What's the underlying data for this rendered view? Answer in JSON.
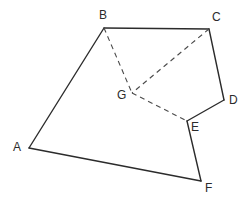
{
  "figure": {
    "name": "hexagon-with-interior-point",
    "width": 248,
    "height": 203,
    "background_color": "#ffffff",
    "stroke_color": "#2b2b2b",
    "dashed_stroke_color": "#4a4a4a",
    "solid_stroke_width": 1.4,
    "dashed_stroke_width": 1.1,
    "dash_pattern": "5,4"
  },
  "points": {
    "A": {
      "label": "A",
      "x": 29,
      "y": 148,
      "label_x": 13,
      "label_y": 141
    },
    "B": {
      "label": "B",
      "x": 104,
      "y": 28,
      "label_x": 99,
      "label_y": 9
    },
    "C": {
      "label": "C",
      "x": 209,
      "y": 29,
      "label_x": 212,
      "label_y": 11
    },
    "D": {
      "label": "D",
      "x": 224,
      "y": 100,
      "label_x": 229,
      "label_y": 94
    },
    "E": {
      "label": "E",
      "x": 187,
      "y": 121,
      "label_x": 191,
      "label_y": 121
    },
    "F": {
      "label": "F",
      "x": 201,
      "y": 181,
      "label_x": 205,
      "label_y": 182
    },
    "G": {
      "label": "G",
      "x": 132,
      "y": 93,
      "label_x": 117,
      "label_y": 89
    }
  },
  "solid_edges": [
    {
      "name": "edge-A-B",
      "from": "A",
      "to": "B"
    },
    {
      "name": "edge-B-C",
      "from": "B",
      "to": "C"
    },
    {
      "name": "edge-C-D",
      "from": "C",
      "to": "D"
    },
    {
      "name": "edge-D-E",
      "from": "D",
      "to": "E"
    },
    {
      "name": "edge-E-F",
      "from": "E",
      "to": "F"
    },
    {
      "name": "edge-F-A",
      "from": "F",
      "to": "A"
    }
  ],
  "dashed_edges": [
    {
      "name": "edge-B-G",
      "from": "B",
      "to": "G"
    },
    {
      "name": "edge-C-G",
      "from": "C",
      "to": "G"
    },
    {
      "name": "edge-G-E",
      "from": "G",
      "to": "E"
    }
  ]
}
